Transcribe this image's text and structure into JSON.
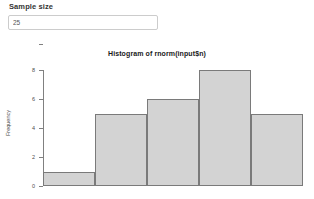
{
  "form": {
    "label": "Sample size",
    "input_value": "25",
    "input_placeholder": ""
  },
  "chart_data": {
    "type": "bar",
    "title": "Histogram of rnorm(input$n)",
    "xlabel": "",
    "ylabel": "Frequency",
    "categories": [
      "bin1",
      "bin2",
      "bin3",
      "bin4",
      "bin5"
    ],
    "values": [
      1,
      5,
      6,
      8,
      5
    ],
    "ylim": [
      0,
      8
    ],
    "yticks": [
      "8",
      "6",
      "4",
      "2",
      "0"
    ],
    "ytick_values": [
      8,
      6,
      4,
      2,
      0
    ],
    "xticks": [],
    "grid": false,
    "legend": false,
    "bar_fill": "#d3d3d3",
    "bar_border": "#7a7a7a",
    "axis_color": "#808080"
  }
}
